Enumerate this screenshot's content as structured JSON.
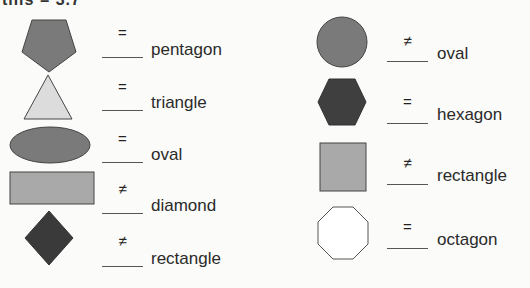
{
  "header": {
    "text": "this = 3.7"
  },
  "colors": {
    "dark": "#3f3f3f",
    "medium": "#7a7a7a",
    "light": "#a9a9a9",
    "very_light": "#dcdcdc",
    "white": "#ffffff",
    "outline": "#444444"
  },
  "left_column": [
    {
      "shape": "pentagon",
      "mark": "=",
      "label": "pentagon"
    },
    {
      "shape": "triangle",
      "mark": "=",
      "label": "triangle"
    },
    {
      "shape": "oval",
      "mark": "=",
      "label": "oval"
    },
    {
      "shape": "rectangle",
      "mark": "≠",
      "label": "diamond"
    },
    {
      "shape": "diamond",
      "mark": "≠",
      "label": "rectangle"
    }
  ],
  "right_column": [
    {
      "shape": "circle",
      "mark": "≠",
      "label": "oval"
    },
    {
      "shape": "hexagon",
      "mark": "=",
      "label": "hexagon"
    },
    {
      "shape": "square",
      "mark": "≠",
      "label": "rectangle"
    },
    {
      "shape": "octagon",
      "mark": "=",
      "label": "octagon"
    }
  ]
}
